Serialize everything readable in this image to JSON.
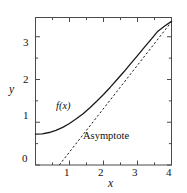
{
  "chart_data": {
    "type": "line",
    "title": "",
    "subtitle": "",
    "xlabel": "x",
    "ylabel": "y",
    "xlim": [
      0,
      4
    ],
    "ylim": [
      0,
      3.45
    ],
    "grid": false,
    "legend_position": "inline-annotations",
    "frame": "box",
    "x_ticks_major": [
      0,
      1,
      2,
      3,
      4
    ],
    "x_tick_labels": [
      "0",
      "1",
      "2",
      "3",
      "4"
    ],
    "x_ticks_minor": [
      0.5,
      1.5,
      2.5,
      3.5
    ],
    "y_ticks_major": [
      0,
      1,
      2,
      3
    ],
    "y_tick_labels": [
      "0",
      "1",
      "2",
      "3"
    ],
    "y_ticks_minor": [
      0.5,
      1.5,
      2.5
    ],
    "series": [
      {
        "name": "f(x)",
        "style": "solid",
        "color": "#1a1a1a",
        "x": [
          0.0,
          0.2,
          0.4,
          0.6,
          0.8,
          1.0,
          1.2,
          1.4,
          1.6,
          1.8,
          2.0,
          2.2,
          2.4,
          2.6,
          2.8,
          3.0,
          3.2,
          3.4,
          3.6,
          3.8,
          4.0
        ],
        "values": [
          0.72,
          0.73,
          0.76,
          0.81,
          0.88,
          0.97,
          1.08,
          1.2,
          1.34,
          1.49,
          1.65,
          1.82,
          2.0,
          2.18,
          2.37,
          2.56,
          2.75,
          2.94,
          3.13,
          3.25,
          3.36
        ]
      },
      {
        "name": "Asymptote",
        "style": "dashed",
        "color": "#1a1a1a",
        "x": [
          0.7,
          4.0
        ],
        "values": [
          0.0,
          3.35
        ]
      }
    ],
    "annotations": [
      {
        "text": "f(x)",
        "x": 1.05,
        "y": 1.42,
        "style": "italic"
      },
      {
        "text": "Asymptote",
        "x": 2.05,
        "y": 0.62,
        "style": "roman"
      }
    ]
  },
  "labels": {
    "x_axis_title": "x",
    "y_axis_title": "y",
    "curve_label": "f(x)",
    "asymptote_label": "Asymptote",
    "x0": "0",
    "x1": "1",
    "x2": "2",
    "x3": "3",
    "x4": "4",
    "y1": "1",
    "y2": "2",
    "y3": "3"
  },
  "colors": {
    "ink": "#1a1a1a",
    "frame": "#4a4a4a",
    "background": "#ffffff"
  }
}
